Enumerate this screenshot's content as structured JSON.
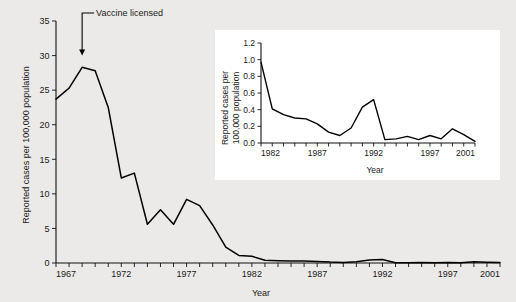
{
  "figure": {
    "background_color": "#eceae8",
    "line_color": "#000000"
  },
  "chart_data": [
    {
      "id": "main",
      "type": "line",
      "title": "",
      "xlabel": "Year",
      "ylabel": "Reported cases per 100,000 population",
      "xlim": [
        1967,
        2001
      ],
      "ylim": [
        0,
        35
      ],
      "yticks": [
        0,
        5,
        10,
        15,
        20,
        25,
        30,
        35
      ],
      "ytick_labels": [
        "0",
        "5",
        "10",
        "15",
        "20",
        "25",
        "30",
        "35"
      ],
      "xticks": [
        1967,
        1972,
        1977,
        1982,
        1987,
        1992,
        1997,
        2001
      ],
      "xtick_labels": [
        "1967",
        "1972",
        "1977",
        "1982",
        "1987",
        "1992",
        "1997",
        "2001"
      ],
      "xtick_interval": 1,
      "grid": false,
      "legend": "none",
      "annotations": [
        {
          "text": "Vaccine licensed",
          "points_to_year": 1969,
          "points_to_value": 30.0
        }
      ],
      "x": [
        1967,
        1968,
        1969,
        1970,
        1971,
        1972,
        1973,
        1974,
        1975,
        1976,
        1977,
        1978,
        1979,
        1980,
        1981,
        1982,
        1983,
        1984,
        1985,
        1986,
        1987,
        1988,
        1989,
        1990,
        1991,
        1992,
        1993,
        1994,
        1995,
        1996,
        1997,
        1998,
        1999,
        2000,
        2001
      ],
      "values": [
        23.7,
        25.3,
        28.3,
        27.8,
        22.5,
        12.3,
        13.0,
        5.6,
        7.7,
        5.6,
        9.2,
        8.3,
        5.5,
        2.3,
        1.1,
        0.97,
        0.41,
        0.34,
        0.3,
        0.29,
        0.23,
        0.13,
        0.09,
        0.18,
        0.43,
        0.52,
        0.04,
        0.05,
        0.08,
        0.04,
        0.09,
        0.05,
        0.17,
        0.1,
        0.06
      ]
    },
    {
      "id": "inset",
      "type": "line",
      "title": "",
      "xlabel": "Year",
      "ylabel_line1": "Reported cases per",
      "ylabel_line2": "100,000 population",
      "xlim": [
        1982,
        2001
      ],
      "ylim": [
        0.0,
        1.2
      ],
      "yticks": [
        0.0,
        0.2,
        0.4,
        0.6,
        0.8,
        1.0,
        1.2
      ],
      "ytick_labels": [
        "0.0",
        "0.2",
        "0.4",
        "0.6",
        "0.8",
        "1.0",
        "1.2"
      ],
      "xticks": [
        1982,
        1987,
        1992,
        1997,
        2001
      ],
      "xtick_labels": [
        "1982",
        "1987",
        "1992",
        "1997",
        "2001"
      ],
      "xtick_interval": 1,
      "grid": false,
      "legend": "none",
      "x": [
        1982,
        1983,
        1984,
        1985,
        1986,
        1987,
        1988,
        1989,
        1990,
        1991,
        1992,
        1993,
        1994,
        1995,
        1996,
        1997,
        1998,
        1999,
        2000,
        2001
      ],
      "values": [
        0.97,
        0.41,
        0.34,
        0.3,
        0.29,
        0.23,
        0.13,
        0.09,
        0.18,
        0.43,
        0.52,
        0.04,
        0.05,
        0.08,
        0.04,
        0.09,
        0.05,
        0.17,
        0.1,
        0.02
      ]
    }
  ]
}
